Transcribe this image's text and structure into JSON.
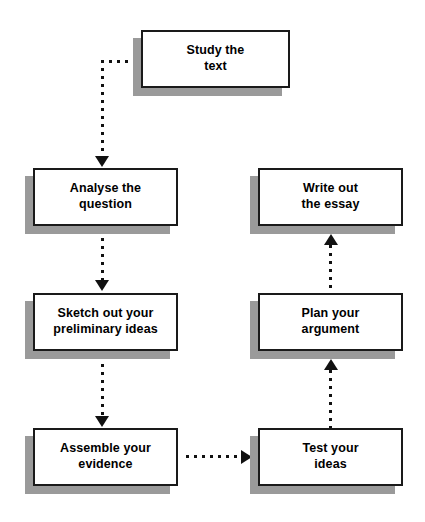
{
  "diagram": {
    "type": "flowchart",
    "colors": {
      "box_fill": "#ffffff",
      "box_border": "#1a1a1a",
      "shadow": "#9a9a9a",
      "connector": "#111111",
      "background": "#ffffff"
    },
    "nodes": [
      {
        "id": "study-the-text",
        "label": "Study the\ntext",
        "column": "right-top"
      },
      {
        "id": "analyse-the-question",
        "label": "Analyse the\nquestion",
        "column": "left"
      },
      {
        "id": "write-out-the-essay",
        "label": "Write out\nthe essay",
        "column": "right"
      },
      {
        "id": "sketch-out-your-preliminary-ideas",
        "label": "Sketch out your\npreliminary ideas",
        "column": "left"
      },
      {
        "id": "plan-your-argument",
        "label": "Plan your\nargument",
        "column": "right"
      },
      {
        "id": "assemble-your-evidence",
        "label": "Assemble your\nevidence",
        "column": "left"
      },
      {
        "id": "test-your-ideas",
        "label": "Test your\nideas",
        "column": "right"
      }
    ],
    "connectors": [
      {
        "id": "study-to-analyse",
        "from": "study-the-text",
        "to": "analyse-the-question",
        "style": "dotted",
        "shape": "elbow",
        "direction": "down"
      },
      {
        "id": "analyse-to-sketch",
        "from": "analyse-the-question",
        "to": "sketch-out-your-preliminary-ideas",
        "style": "dotted",
        "shape": "straight",
        "direction": "down"
      },
      {
        "id": "sketch-to-assemble",
        "from": "sketch-out-your-preliminary-ideas",
        "to": "assemble-your-evidence",
        "style": "dotted",
        "shape": "straight",
        "direction": "down"
      },
      {
        "id": "assemble-to-test",
        "from": "assemble-your-evidence",
        "to": "test-your-ideas",
        "style": "dotted",
        "shape": "straight",
        "direction": "right"
      },
      {
        "id": "test-to-plan",
        "from": "test-your-ideas",
        "to": "plan-your-argument",
        "style": "dotted",
        "shape": "straight",
        "direction": "up"
      },
      {
        "id": "plan-to-write",
        "from": "plan-your-argument",
        "to": "write-out-the-essay",
        "style": "dotted",
        "shape": "straight",
        "direction": "up"
      }
    ]
  }
}
